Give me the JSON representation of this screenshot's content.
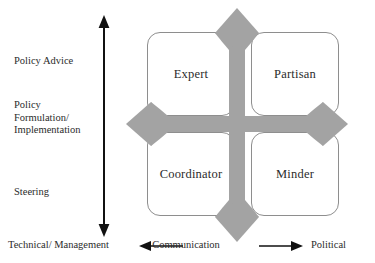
{
  "diagram": {
    "colors": {
      "cross_gray": "#a3a3a3",
      "box_border": "#8e8e8e",
      "text": "#2b2b2b",
      "axis_black": "#111111",
      "background": "#ffffff"
    }
  },
  "vertical_axis": {
    "arrow_type": "double-headed-vertical",
    "tiers": [
      {
        "id": "policy-advice",
        "label": "Policy Advice"
      },
      {
        "id": "policy-formulation",
        "label": "Policy\nFormulation/\nImplementation"
      },
      {
        "id": "steering",
        "label": "Steering"
      }
    ]
  },
  "horizontal_axis": {
    "left_label": "Technical/ Management",
    "center_label": "Communication",
    "right_label": "Political",
    "left_arrow_icon": "arrow-left-icon",
    "right_arrow_icon": "arrow-right-icon"
  },
  "matrix": {
    "quadrants": [
      {
        "id": "expert",
        "label": "Expert",
        "position": "top-left"
      },
      {
        "id": "partisan",
        "label": "Partisan",
        "position": "top-right"
      },
      {
        "id": "coordinator",
        "label": "Coordinator",
        "position": "bottom-left"
      },
      {
        "id": "minder",
        "label": "Minder",
        "position": "bottom-right"
      }
    ]
  },
  "cross_overlay": {
    "icon": "four-way-arrow-cross-icon",
    "arrowheads": [
      "up",
      "down",
      "left",
      "right"
    ]
  }
}
